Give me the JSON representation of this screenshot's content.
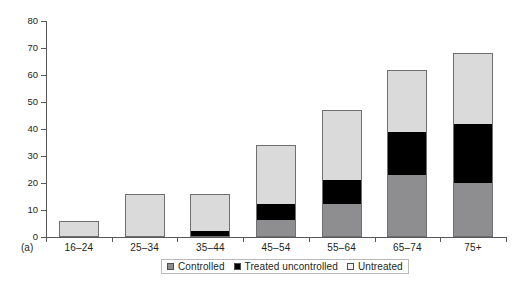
{
  "chart_data": {
    "type": "bar",
    "stacked": true,
    "title": "",
    "subtitle": "",
    "xlabel": "",
    "ylabel": "",
    "panel_label": "(a)",
    "categories": [
      "16–24",
      "25–34",
      "35–44",
      "45–54",
      "55–64",
      "65–74",
      "75+"
    ],
    "series": [
      {
        "name": "Controlled",
        "color": "#8e8e90",
        "values": [
          0,
          0,
          0,
          6,
          12,
          23,
          20
        ]
      },
      {
        "name": "Treated uncontrolled",
        "color": "#000000",
        "values": [
          0,
          0,
          2,
          6,
          9,
          16,
          22
        ]
      },
      {
        "name": "Untreated",
        "color": "#dadada",
        "values": [
          6,
          16,
          14,
          22,
          26,
          23,
          26
        ]
      }
    ],
    "totals": [
      6,
      16,
      16,
      34,
      47,
      62,
      68
    ],
    "ylim": [
      0,
      80
    ],
    "yticks": [
      0,
      10,
      20,
      30,
      40,
      50,
      60,
      70,
      80
    ],
    "ytick_labels": [
      "0",
      "10",
      "20",
      "30",
      "40",
      "50",
      "60",
      "70",
      "80"
    ],
    "grid": false,
    "legend_position": "bottom-center",
    "legend_entries": [
      {
        "label": "Controlled",
        "swatch": "dark-gray"
      },
      {
        "label": "Treated uncontrolled",
        "swatch": "black"
      },
      {
        "label": "Untreated",
        "swatch": "light-gray"
      }
    ]
  },
  "axis": {
    "y_labels": [
      "80",
      "70",
      "60",
      "50",
      "40",
      "30",
      "20",
      "10",
      "0"
    ],
    "x_labels": [
      "16–24",
      "25–34",
      "35–44",
      "45–54",
      "55–64",
      "65–74",
      "75+"
    ]
  },
  "panel": {
    "tag": "(a)"
  }
}
